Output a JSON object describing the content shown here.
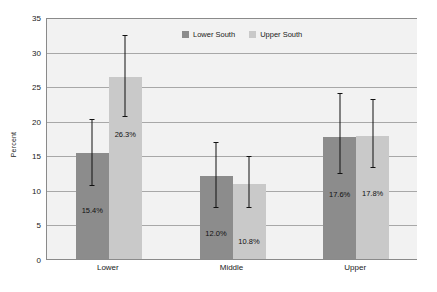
{
  "chart_data": {
    "type": "bar",
    "title": "",
    "subtitle": "",
    "xlabel": "",
    "ylabel": "Percent",
    "categories": [
      "Lower",
      "Middle",
      "Upper"
    ],
    "ylim": [
      0,
      35
    ],
    "yticks": [
      0,
      5,
      10,
      15,
      20,
      25,
      30,
      35
    ],
    "ytick_labels": [
      "0",
      "5",
      "10",
      "15",
      "20",
      "25",
      "30",
      "35"
    ],
    "grid": true,
    "legend_position": "top-center",
    "series": [
      {
        "name": "Lower South",
        "color": "#8c8c8c",
        "values": [
          15.4,
          12.0,
          17.6
        ],
        "data_labels": [
          "15.4%",
          "12.0%",
          "17.6%"
        ],
        "error_low": [
          10.9,
          7.7,
          12.6
        ],
        "error_high": [
          20.4,
          17.0,
          24.1
        ]
      },
      {
        "name": "Upper South",
        "color": "#c9c9c9",
        "values": [
          26.3,
          10.8,
          17.8
        ],
        "data_labels": [
          "26.3%",
          "10.8%",
          "17.8%"
        ],
        "error_low": [
          20.8,
          7.6,
          13.4
        ],
        "error_high": [
          32.5,
          15.0,
          23.3
        ]
      }
    ]
  }
}
